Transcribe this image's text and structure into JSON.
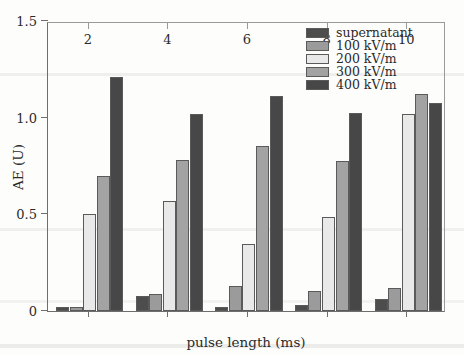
{
  "chart_data": {
    "type": "bar",
    "title": "",
    "xlabel": "pulse length (ms)",
    "ylabel": "AE (U)",
    "categories": [
      "2",
      "4",
      "6",
      "8",
      "10"
    ],
    "xlim": [
      1,
      11
    ],
    "ylim": [
      0,
      1.5
    ],
    "ytick_labels": [
      "0",
      "0.5",
      "1.0",
      "1.5"
    ],
    "ytick_values": [
      0,
      0.5,
      1.0,
      1.5
    ],
    "xtick_labels": [
      "2",
      "4",
      "6",
      "8",
      "10"
    ],
    "xtick_values": [
      2,
      4,
      6,
      8,
      10
    ],
    "grid": false,
    "legend_position": "top-right",
    "series": [
      {
        "name": "supernatant",
        "color": "#4d4d4d",
        "values": [
          0.02,
          0.08,
          0.02,
          0.03,
          0.06
        ]
      },
      {
        "name": "100 kV/m",
        "color": "#9b9b9b",
        "values": [
          0.02,
          0.09,
          0.13,
          0.105,
          0.12
        ]
      },
      {
        "name": "200 kV/m",
        "color": "#e9e9e9",
        "values": [
          0.5,
          0.57,
          0.345,
          0.485,
          1.02
        ]
      },
      {
        "name": "300 kV/m",
        "color": "#a3a3a3",
        "values": [
          0.7,
          0.78,
          0.855,
          0.775,
          1.12
        ]
      },
      {
        "name": "400 kV/m",
        "color": "#474747",
        "values": [
          1.21,
          1.02,
          1.11,
          1.025,
          1.075
        ]
      }
    ]
  }
}
